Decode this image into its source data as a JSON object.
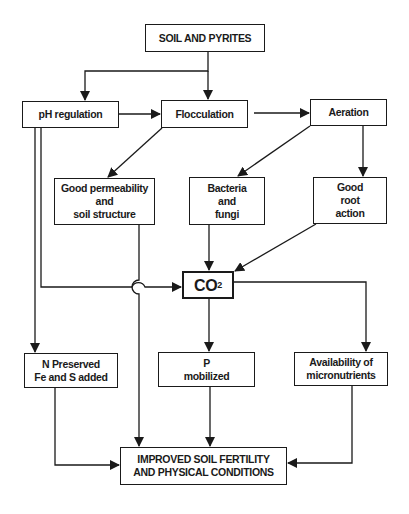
{
  "diagram": {
    "colors": {
      "line": "#1a1a1a",
      "background": "#ffffff"
    },
    "nodes": {
      "soil": "SOIL AND PYRITES",
      "ph": "pH regulation",
      "floc": "Flocculation",
      "aeration": "Aeration",
      "perm": "Good permeability\nand\nsoil structure",
      "bact": "Bacteria\nand\nfungi",
      "root": "Good\nroot\naction",
      "co2_main": "CO",
      "co2_sub": "2",
      "n": "N Preserved\nFe and S added",
      "p": "P\nmobilized",
      "avail": "Availability of\nmicronutrients",
      "result": "IMPROVED SOIL FERTILITY\nAND PHYSICAL CONDITIONS"
    },
    "edges": [
      [
        "soil",
        "ph"
      ],
      [
        "soil",
        "floc"
      ],
      [
        "ph",
        "floc"
      ],
      [
        "floc",
        "aeration"
      ],
      [
        "floc",
        "perm"
      ],
      [
        "aeration",
        "bact"
      ],
      [
        "aeration",
        "root"
      ],
      [
        "bact",
        "co2"
      ],
      [
        "root",
        "co2"
      ],
      [
        "ph",
        "co2"
      ],
      [
        "ph",
        "n"
      ],
      [
        "co2",
        "p"
      ],
      [
        "co2",
        "avail"
      ],
      [
        "perm",
        "result"
      ],
      [
        "n",
        "result"
      ],
      [
        "p",
        "result"
      ],
      [
        "avail",
        "result"
      ]
    ]
  }
}
